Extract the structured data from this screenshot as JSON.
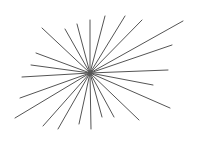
{
  "figure": {
    "type": "starburst",
    "background": "#ffffff",
    "stroke": "#555555",
    "stroke_width": 1,
    "center": [
      90,
      73
    ],
    "endpoints": [
      [
        42,
        28
      ],
      [
        65,
        29
      ],
      [
        77,
        24
      ],
      [
        90,
        20
      ],
      [
        105,
        16
      ],
      [
        125,
        16
      ],
      [
        142,
        20
      ],
      [
        183,
        21
      ],
      [
        172,
        45
      ],
      [
        168,
        70
      ],
      [
        36,
        53
      ],
      [
        31,
        65
      ],
      [
        22,
        77
      ],
      [
        20,
        98
      ],
      [
        15,
        118
      ],
      [
        43,
        126
      ],
      [
        58,
        129
      ],
      [
        79,
        124
      ],
      [
        91,
        129
      ],
      [
        102,
        117
      ],
      [
        114,
        117
      ],
      [
        139,
        120
      ],
      [
        170,
        108
      ],
      [
        153,
        85
      ]
    ]
  }
}
